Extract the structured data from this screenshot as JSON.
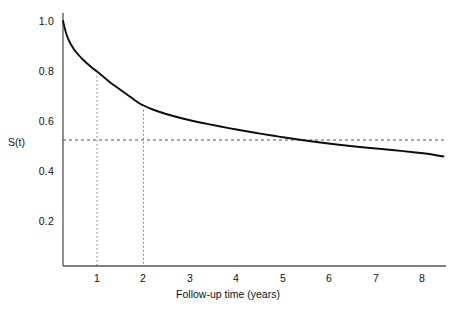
{
  "chart_data": {
    "type": "line",
    "title": "",
    "subtitle": "",
    "xlabel": "Follow-up time (years)",
    "ylabel": "S(t)",
    "xlim": [
      0.27,
      8.45
    ],
    "ylim": [
      0.116,
      1.04
    ],
    "grid": false,
    "legend": null,
    "x_ticks": [
      1,
      2,
      3,
      4,
      5,
      6,
      7,
      8
    ],
    "x_tick_labels": [
      "1",
      "2",
      "3",
      "4",
      "5",
      "6",
      "7",
      "8"
    ],
    "y_ticks": [
      0.2,
      0.4,
      0.6,
      0.8,
      1.0
    ],
    "y_tick_labels": [
      "0.2",
      "0.4",
      "0.6",
      "0.8",
      "1.0"
    ],
    "series": [
      {
        "name": "Survival function S(t)",
        "style": "solid",
        "color": "#000000",
        "x": [
          0.27,
          0.33,
          0.4,
          0.5,
          0.6,
          0.7,
          0.8,
          0.9,
          1.0,
          1.15,
          1.3,
          1.45,
          1.6,
          1.75,
          1.9,
          2.0,
          2.2,
          2.4,
          2.6,
          2.8,
          3.0,
          3.3,
          3.6,
          4.0,
          4.4,
          4.8,
          5.0,
          5.4,
          5.8,
          6.2,
          6.6,
          7.0,
          7.4,
          7.8,
          8.1,
          8.45
        ],
        "y": [
          1.0,
          0.955,
          0.92,
          0.888,
          0.865,
          0.845,
          0.828,
          0.812,
          0.798,
          0.775,
          0.752,
          0.732,
          0.712,
          0.692,
          0.672,
          0.662,
          0.646,
          0.633,
          0.622,
          0.612,
          0.603,
          0.591,
          0.58,
          0.566,
          0.553,
          0.541,
          0.535,
          0.524,
          0.514,
          0.505,
          0.497,
          0.49,
          0.483,
          0.475,
          0.469,
          0.458
        ]
      }
    ],
    "annotations": [
      {
        "name": "median-survival-level",
        "type": "hline",
        "style": "dashed",
        "y": 0.524,
        "x_from": 0.27,
        "x_to": 8.45
      },
      {
        "name": "one-year-marker",
        "type": "vline",
        "style": "dotted",
        "x": 1.0,
        "y_from": 0.116,
        "y_to": 0.798
      },
      {
        "name": "two-year-marker",
        "type": "vline",
        "style": "dotted",
        "x": 2.0,
        "y_from": 0.116,
        "y_to": 0.662
      }
    ]
  },
  "axes": {
    "y_title": "S(t)",
    "x_title": "Follow-up time (years)",
    "y_tick_labels": [
      "1.0",
      "0.8",
      "0.6",
      "0.4",
      "0.2"
    ],
    "x_tick_labels": [
      "1",
      "2",
      "3",
      "4",
      "5",
      "6",
      "7",
      "8"
    ]
  },
  "colors": {
    "curve": "#0d0d0d",
    "axis": "#4d4d4d",
    "annotation": "#555555",
    "text": "#111111",
    "background": "#ffffff"
  }
}
